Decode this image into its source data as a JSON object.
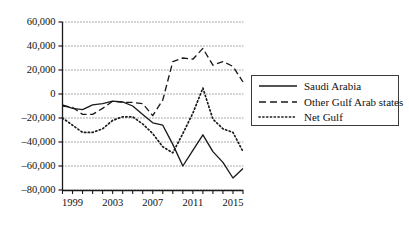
{
  "chart_data": {
    "type": "line",
    "title": "",
    "subtitle": "",
    "xlabel": "",
    "ylabel": "",
    "grid": true,
    "grid_axis": "y",
    "legend_position": "right",
    "xlim": [
      1998,
      2016
    ],
    "ylim": [
      -80000,
      60000
    ],
    "x": [
      1998,
      1999,
      2000,
      2001,
      2002,
      2003,
      2004,
      2005,
      2006,
      2007,
      2008,
      2009,
      2010,
      2011,
      2012,
      2013,
      2014,
      2015,
      2016
    ],
    "x_tick_labels": [
      "1999",
      "2003",
      "2007",
      "2011",
      "2015"
    ],
    "x_tick_label_values": [
      1999,
      2003,
      2007,
      2011,
      2015
    ],
    "y_tick_labels": [
      "60,000",
      "40,000",
      "20,000",
      "0",
      "–20,000",
      "–40,000",
      "–60,000",
      "–80,000"
    ],
    "y_tick_values": [
      60000,
      40000,
      20000,
      0,
      -20000,
      -40000,
      -60000,
      -80000
    ],
    "series": [
      {
        "name": "Saudi Arabia",
        "style": "solid",
        "color": "#1a1a1a",
        "values": [
          -9000,
          -12000,
          -13000,
          -9000,
          -8000,
          -6000,
          -6500,
          -10000,
          -17000,
          -24000,
          -26000,
          -42000,
          -60000,
          -47000,
          -34000,
          -48000,
          -57000,
          -70000,
          -62000
        ]
      },
      {
        "name": "Other Gulf Arab states",
        "style": "dashed",
        "color": "#1a1a1a",
        "values": [
          -10000,
          -11000,
          -17000,
          -17000,
          -12000,
          -6000,
          -7000,
          -7000,
          -8000,
          -18000,
          -5000,
          27000,
          30000,
          29000,
          38000,
          24000,
          27000,
          23000,
          10000
        ]
      },
      {
        "name": "Net Gulf",
        "style": "dotted",
        "color": "#1a1a1a",
        "values": [
          -20000,
          -26000,
          -32000,
          -32000,
          -29000,
          -22000,
          -19000,
          -19000,
          -25000,
          -33000,
          -44000,
          -49000,
          -33000,
          -16000,
          5000,
          -21000,
          -29000,
          -32000,
          -48000
        ]
      }
    ]
  },
  "legend": {
    "items": [
      {
        "label": "Saudi Arabia",
        "style": "solid"
      },
      {
        "label": "Other Gulf Arab states",
        "style": "dashed"
      },
      {
        "label": "Net Gulf",
        "style": "dotted"
      }
    ]
  }
}
